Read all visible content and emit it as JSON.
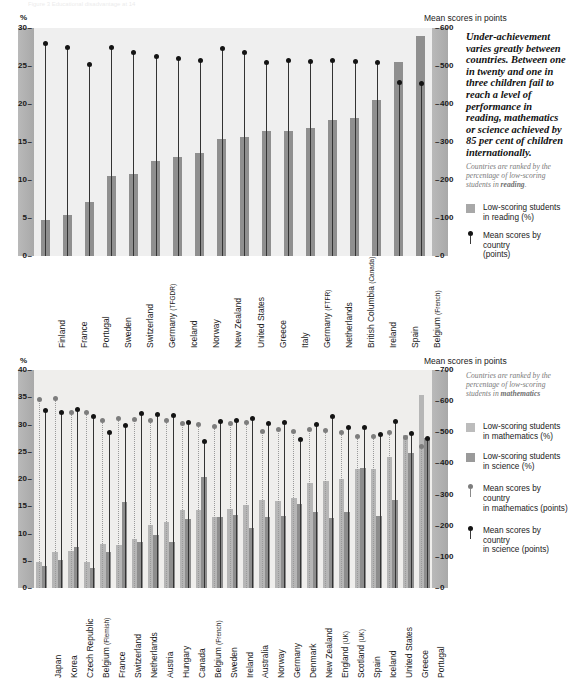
{
  "page": {
    "ghost_header": "Figure 3  Educational disadvantage at 14"
  },
  "reading_panel": {
    "axis_unit": "%",
    "right_axis_title": "Mean scores in points",
    "title_main": "Reading",
    "title_rest": "– 14-year-olds (1991)",
    "y_left_ticks": [
      "30",
      "25",
      "20",
      "15",
      "10",
      "5",
      "0"
    ],
    "y_right_ticks": [
      "600",
      "500",
      "400",
      "300",
      "200",
      "100",
      "0"
    ],
    "lede": "Under-achievement varies greatly between countries. Between one in twenty and one in three children fail to reach a level of performance in reading, mathematics or science achieved by 85 per cent of children internationally.",
    "rank_note_pre": "Countries are ranked by the percentage of low-scoring students in ",
    "rank_note_bold": "reading",
    "rank_note_post": ".",
    "legend": [
      {
        "icon": "bar-swatch-reading",
        "line1": "Low-scoring students",
        "line2": "in reading (%)"
      },
      {
        "icon": "dot-black",
        "line1": "Mean scores by country",
        "line2": "(points)"
      }
    ]
  },
  "maths_panel": {
    "axis_unit": "%",
    "right_axis_title": "Mean scores in points",
    "title_main": "Mathematics and Science",
    "title_rest": "– 13-year-olds",
    "title_footnote": "1",
    "title_years": "(1994-1995)",
    "y_left_ticks": [
      "40",
      "35",
      "30",
      "25",
      "20",
      "15",
      "10",
      "5",
      "0"
    ],
    "y_right_ticks": [
      "700",
      "600",
      "500",
      "400",
      "300",
      "200",
      "100",
      "0"
    ],
    "rank_note_pre": "Countries are ranked by the percentage of low-scoring students in ",
    "rank_note_bold": "mathematics",
    "rank_note_post": "",
    "legend": [
      {
        "icon": "bar-swatch-maths",
        "line1": "Low-scoring students",
        "line2": "in mathematics (%)"
      },
      {
        "icon": "bar-swatch-science",
        "line1": "Low-scoring students",
        "line2": "in science (%)"
      },
      {
        "icon": "dot-grey",
        "line1": "Mean scores by country",
        "line2": "in mathematics (points)"
      },
      {
        "icon": "dot-black",
        "line1": "Mean scores by country",
        "line2": "in science (points)"
      }
    ]
  },
  "chart_data": [
    {
      "type": "bar",
      "id": "reading-14-year-olds",
      "title": "Reading – 14-year-olds (1991)",
      "xlabel": "",
      "ylabel": "%",
      "y2label": "Mean scores in points",
      "ylim": [
        0,
        30
      ],
      "y2lim": [
        0,
        600
      ],
      "yticks": [
        0,
        5,
        10,
        15,
        20,
        25,
        30
      ],
      "y2ticks": [
        0,
        100,
        200,
        300,
        400,
        500,
        600
      ],
      "grid": false,
      "legend_position": "right",
      "categories": [
        "Finland",
        "France",
        "Portugal",
        "Sweden",
        "Switzerland",
        "Germany (TFGDR)",
        "Iceland",
        "Norway",
        "New Zealand",
        "United States",
        "Greece",
        "Italy",
        "Germany (FTFR)",
        "Netherlands",
        "British Columbia (Canada)",
        "Ireland",
        "Spain",
        "Belgium (French)"
      ],
      "category_subscripts": {
        "Germany (TFGDR)": "(TFGDR)",
        "Germany (FTFR)": "(FTFR)",
        "British Columbia (Canada)": "(Canada)",
        "Belgium (French)": "(French)"
      },
      "series": [
        {
          "name": "Low-scoring students in reading (%)",
          "axis": "left",
          "unit": "%",
          "values": [
            4.7,
            5.4,
            7.1,
            10.5,
            10.8,
            12.5,
            13.0,
            13.5,
            15.4,
            15.7,
            16.4,
            16.4,
            16.8,
            17.9,
            18.1,
            20.5,
            25.5,
            29.0
          ]
        },
        {
          "name": "Mean scores by country (points)",
          "axis": "right",
          "unit": "points",
          "values": [
            558,
            549,
            505,
            550,
            536,
            524,
            521,
            515,
            545,
            535,
            509,
            515,
            512,
            514,
            512,
            509,
            456,
            453
          ]
        }
      ]
    },
    {
      "type": "bar",
      "id": "maths-and-science-13-year-olds",
      "title": "Mathematics and Science – 13-year-olds (1994-1995)",
      "footnote_marker": "1",
      "xlabel": "",
      "ylabel": "%",
      "y2label": "Mean scores in points",
      "ylim": [
        0,
        40
      ],
      "y2lim": [
        0,
        700
      ],
      "yticks": [
        0,
        5,
        10,
        15,
        20,
        25,
        30,
        35,
        40
      ],
      "y2ticks": [
        0,
        100,
        200,
        300,
        400,
        500,
        600,
        700
      ],
      "grid": false,
      "legend_position": "right",
      "categories": [
        "Japan",
        "Korea",
        "Czech Republic",
        "Belgium (Flemish)",
        "France",
        "Switzerland",
        "Netherlands",
        "Austria",
        "Hungary",
        "Canada",
        "Belgium (French)",
        "Sweden",
        "Ireland",
        "Australia",
        "Norway",
        "Germany",
        "Denmark",
        "New Zealand",
        "England (UK)",
        "Scotland (UK)",
        "Spain",
        "Iceland",
        "United States",
        "Greece",
        "Portugal"
      ],
      "category_subscripts": {
        "Belgium (Flemish)": "(Flemish)",
        "Belgium (French)": "(French)",
        "England (UK)": "(UK)",
        "Scotland (UK)": "(UK)"
      },
      "series": [
        {
          "name": "Low-scoring students in mathematics (%)",
          "axis": "left",
          "unit": "%",
          "values": [
            4.8,
            6.6,
            6.8,
            4.8,
            8.0,
            7.9,
            9.0,
            11.5,
            12.2,
            14.4,
            14.4,
            13.0,
            14.5,
            15.2,
            16.2,
            15.9,
            16.5,
            19.2,
            19.6,
            20.0,
            21.9,
            21.8,
            24.1,
            28.0,
            35.5
          ]
        },
        {
          "name": "Low-scoring students in science (%)",
          "axis": "left",
          "unit": "%",
          "values": [
            4.0,
            5.2,
            7.5,
            3.6,
            6.7,
            15.8,
            8.4,
            9.8,
            8.4,
            12.7,
            20.3,
            13.0,
            13.4,
            11.0,
            13.0,
            13.2,
            15.5,
            13.9,
            12.8,
            14.0,
            22.0,
            13.2,
            16.2,
            24.8,
            27.5
          ]
        },
        {
          "name": "Mean scores by country in mathematics (points)",
          "axis": "right",
          "unit": "points",
          "values": [
            605,
            607,
            564,
            565,
            538,
            545,
            541,
            539,
            537,
            527,
            526,
            519,
            527,
            530,
            503,
            509,
            502,
            508,
            506,
            498,
            487,
            487,
            500,
            484,
            454
          ]
        },
        {
          "name": "Mean scores by country in science (points)",
          "axis": "right",
          "unit": "points",
          "values": [
            571,
            565,
            574,
            550,
            498,
            522,
            560,
            558,
            554,
            531,
            471,
            535,
            538,
            545,
            527,
            531,
            478,
            525,
            552,
            517,
            517,
            494,
            534,
            497,
            480
          ]
        }
      ]
    }
  ]
}
